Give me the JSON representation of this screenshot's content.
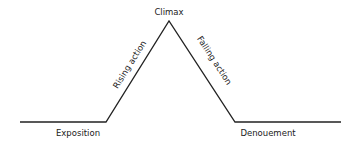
{
  "diagram": {
    "type": "plot-structure (Freytag's pyramid)",
    "stages": [
      {
        "id": "exposition",
        "label": "Exposition"
      },
      {
        "id": "rising-action",
        "label": "Rising action"
      },
      {
        "id": "climax",
        "label": "Climax"
      },
      {
        "id": "falling-action",
        "label": "Falling action"
      },
      {
        "id": "denouement",
        "label": "Denouement"
      }
    ],
    "line_color": "#222222",
    "background": "#ffffff"
  }
}
